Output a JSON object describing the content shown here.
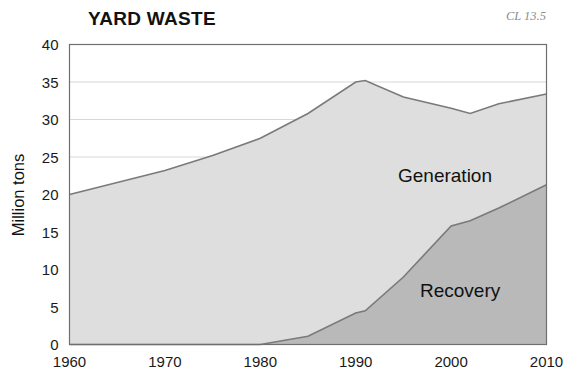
{
  "header": {
    "title": "YARD WASTE",
    "corner_code": "CL 13.5"
  },
  "axes": {
    "y_title": "Million tons",
    "y_ticks": [
      "0",
      "5",
      "10",
      "15",
      "20",
      "25",
      "30",
      "35",
      "40"
    ],
    "x_ticks": [
      "1960",
      "1970",
      "1980",
      "1990",
      "2000",
      "2010"
    ]
  },
  "colors": {
    "generation_fill": "#dedede",
    "recovery_fill": "#b9b9b9",
    "line": "#7a7a7a",
    "frame": "#6f6f6f",
    "grid": "#d8d8d8",
    "text": "#111111",
    "corner_text": "#8d8d8d",
    "background": "#ffffff"
  },
  "series_labels": {
    "generation": "Generation",
    "recovery": "Recovery"
  },
  "chart_data": {
    "type": "area",
    "title": "YARD WASTE",
    "subtitle": "CL 13.5",
    "xlabel": "",
    "ylabel": "Million tons",
    "xlim": [
      1960,
      2010
    ],
    "ylim": [
      0,
      40
    ],
    "grid": true,
    "legend": "inline-annotations",
    "x": [
      1960,
      1965,
      1970,
      1975,
      1980,
      1985,
      1990,
      1991,
      1995,
      2000,
      2002,
      2005,
      2010
    ],
    "series": [
      {
        "name": "Generation",
        "values": [
          20.0,
          21.6,
          23.2,
          25.2,
          27.5,
          30.8,
          35.0,
          35.2,
          33.0,
          31.5,
          30.8,
          32.1,
          33.4
        ]
      },
      {
        "name": "Recovery",
        "values": [
          0.0,
          0.0,
          0.0,
          0.0,
          0.0,
          1.1,
          4.2,
          4.5,
          9.0,
          15.8,
          16.5,
          18.2,
          21.3
        ]
      }
    ],
    "annotations": [
      {
        "text": "Generation",
        "x": 1993,
        "y": 23.5
      },
      {
        "text": "Recovery",
        "x": 1994,
        "y": 8.0
      }
    ]
  }
}
